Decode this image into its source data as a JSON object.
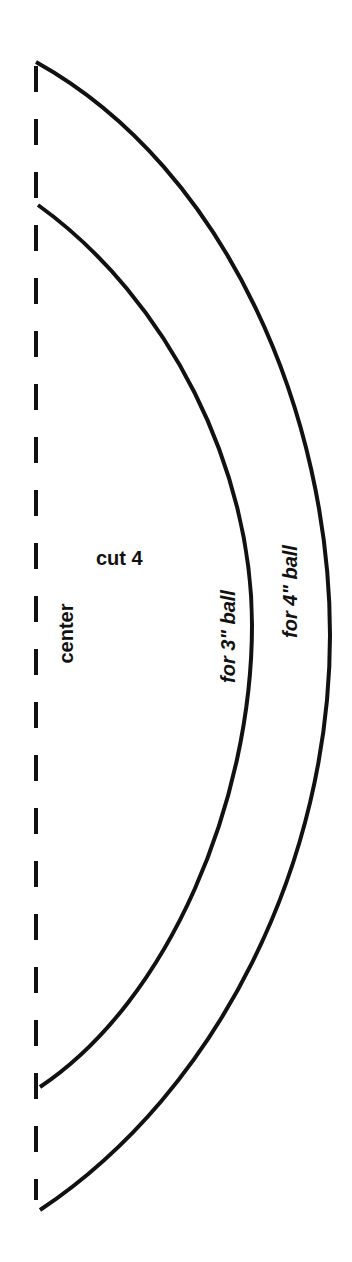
{
  "pattern": {
    "labels": {
      "cut": "cut 4",
      "center": "center",
      "inner": "for 3\" ball",
      "outer": "for 4\" ball"
    },
    "colors": {
      "line": "#111111",
      "background": "#ffffff"
    }
  }
}
